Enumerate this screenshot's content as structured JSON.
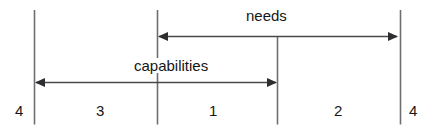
{
  "diagram": {
    "type": "double-arrow-range-diagram",
    "background_color": "#ffffff",
    "line_color": "#6e6e70",
    "arrow_color": "#3a3a3c",
    "text_color": "#161616",
    "arrows": [
      {
        "id": "needs-arrow",
        "label": "needs",
        "direction": "both",
        "spans_segments": [
          "1",
          "2"
        ]
      },
      {
        "id": "capabilities-arrow",
        "label": "capabilities",
        "direction": "both",
        "spans_segments": [
          "3",
          "1"
        ]
      }
    ],
    "segment_labels": {
      "far_left": "4",
      "left": "3",
      "center": "1",
      "right": "2",
      "far_right": "4"
    },
    "dividers": 4
  }
}
